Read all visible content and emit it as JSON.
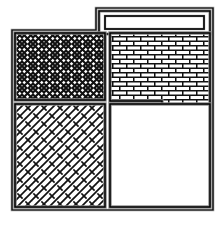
{
  "figure": {
    "title": "Masonry pattern layout plan",
    "type": "hatched-floor-plan",
    "canvas": {
      "width": 224,
      "height": 228,
      "background": "#ffffff"
    },
    "line_color": "#000000",
    "outline_color": "#7a7a7a",
    "fill_color": "#ffffff"
  },
  "regions": [
    {
      "id": "top-bar",
      "name": "Top lintel bar",
      "pattern": "blank",
      "pattern_label": "Plain / unhatched",
      "x": 99,
      "y": 11,
      "width": 111,
      "height": 23
    },
    {
      "id": "upper-left",
      "name": "Upper left panel",
      "pattern": "herringbone",
      "pattern_label": "Herringbone bond",
      "x": 15,
      "y": 33,
      "width": 90,
      "height": 67
    },
    {
      "id": "upper-right",
      "name": "Upper right panel",
      "pattern": "running-bond",
      "pattern_label": "Running bond brick",
      "x": 110,
      "y": 33,
      "width": 100,
      "height": 95,
      "notch": {
        "x": 162,
        "y": 101,
        "width": 48,
        "height": 27
      }
    },
    {
      "id": "lower-left",
      "name": "Lower left panel",
      "pattern": "diagonal-bond",
      "pattern_label": "Diagonal bond hatch",
      "x": 15,
      "y": 104,
      "width": 90,
      "height": 103
    },
    {
      "id": "lower-right",
      "name": "Lower right panel",
      "pattern": "blank",
      "pattern_label": "Plain / unhatched",
      "x": 110,
      "y": 104,
      "width": 100,
      "height": 103
    }
  ],
  "legend": {
    "herringbone": "Herringbone bond",
    "running_bond": "Running bond brick",
    "diagonal_bond": "Diagonal bond hatch",
    "blank": "Plain / unhatched"
  }
}
